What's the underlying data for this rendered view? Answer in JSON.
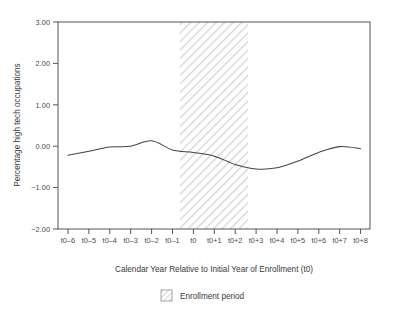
{
  "chart_data": {
    "type": "line",
    "title": "",
    "xlabel": "Calendar Year Relative to Initial Year of Enrollment (t0)",
    "ylabel": "Percentage high tech occupations",
    "categories": [
      "t0–6",
      "t0–5",
      "t0–4",
      "t0–3",
      "t0–2",
      "t0–1",
      "t0",
      "t0+1",
      "t0+2",
      "t0+3",
      "t0+4",
      "t0+5",
      "t0+6",
      "t0+7",
      "t0+8"
    ],
    "values": [
      -0.22,
      -0.12,
      -0.02,
      0.0,
      0.13,
      -0.09,
      -0.15,
      -0.24,
      -0.44,
      -0.55,
      -0.52,
      -0.36,
      -0.15,
      -0.01,
      -0.06
    ],
    "series": [
      {
        "name": "Percentage high tech occupations",
        "values": [
          -0.22,
          -0.12,
          -0.02,
          0.0,
          0.13,
          -0.09,
          -0.15,
          -0.24,
          -0.44,
          -0.55,
          -0.52,
          -0.36,
          -0.15,
          -0.01,
          -0.06
        ],
        "color": "#444444"
      }
    ],
    "ylim": [
      -2.0,
      3.0
    ],
    "yticks": [
      3.0,
      2.0,
      1.0,
      0.0,
      -1.0,
      -2.0
    ],
    "ytick_labels": [
      "3.00",
      "2.00",
      "1.00",
      "0.00",
      "−1.00",
      "−2.00"
    ],
    "xtick_labels": [
      "t0–6",
      "t0–5",
      "t0–4",
      "t0–3",
      "t0–2",
      "t0–1",
      "t0",
      "t0+1",
      "t0+2",
      "t0+3",
      "t0+4",
      "t0+5",
      "t0+6",
      "t0+7",
      "t0+8"
    ],
    "grid": false,
    "legend_position": "bottom-center",
    "shaded_region": {
      "label": "Enrollment period",
      "start_category": "t0–1",
      "end_category": "t0+2",
      "pattern": "diagonal-hatch",
      "color": "#d9d9d9"
    },
    "annotations": []
  },
  "axes": {
    "y_title": "Percentage high tech occupations",
    "x_title": "Calendar Year Relative to Initial Year of Enrollment (t0)",
    "frame_color": "#555555"
  },
  "legend": {
    "items": [
      {
        "label": "Enrollment period",
        "swatch": "hatch-swatch"
      }
    ]
  },
  "colors": {
    "background": "#ffffff",
    "line": "#444444",
    "hatch": "#d0d0d0",
    "axis": "#555555",
    "text": "#3a3a3a"
  }
}
